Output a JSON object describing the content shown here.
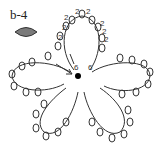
{
  "diagram": {
    "label": "b-4",
    "shuttle_icon": {
      "name": "lens-shuttle-icon",
      "fill": "#7a7a7a",
      "stroke": "#333333"
    },
    "top_petal_labels": [
      "2",
      "2",
      "2",
      "2",
      "2",
      "2",
      "2",
      "2"
    ],
    "center_labels": [
      "6",
      "6"
    ],
    "center_dot_color": "#000000",
    "petal_count": 5,
    "line_color": "#333333"
  }
}
